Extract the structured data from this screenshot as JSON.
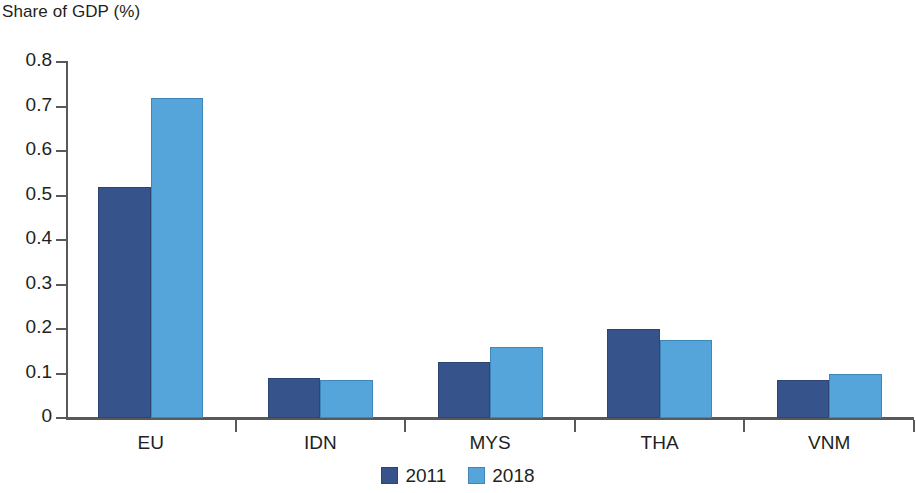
{
  "chart_data": {
    "type": "bar",
    "title": "Share of GDP (%)",
    "xlabel": "",
    "ylabel": "",
    "ylim": [
      0,
      0.8
    ],
    "ytick_labels": [
      "0.8",
      "0.7",
      "0.6",
      "0.5",
      "0.4",
      "0.3",
      "0.2",
      "0.1",
      "0"
    ],
    "ytick_values": [
      0.8,
      0.7,
      0.6,
      0.5,
      0.4,
      0.3,
      0.2,
      0.1,
      0
    ],
    "grid": false,
    "legend_position": "bottom-center",
    "categories": [
      "EU",
      "IDN",
      "MYS",
      "THA",
      "VNM"
    ],
    "series": [
      {
        "name": "2011",
        "color": "#37538c",
        "values": [
          0.52,
          0.09,
          0.125,
          0.2,
          0.085
        ]
      },
      {
        "name": "2018",
        "color": "#55a5db",
        "values": [
          0.72,
          0.085,
          0.16,
          0.175,
          0.1
        ]
      }
    ]
  }
}
